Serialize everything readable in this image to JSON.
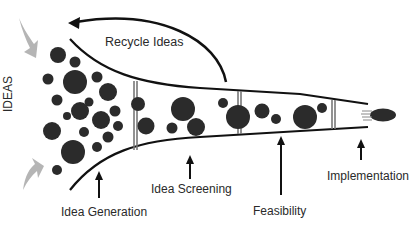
{
  "diagram": {
    "labels": {
      "ideas": "IDEAS",
      "recycle": "Recycle Ideas",
      "idea_generation": "Idea Generation",
      "idea_screening": "Idea Screening",
      "feasibility": "Feasibility",
      "implementation": "Implementation"
    },
    "stages": [
      "Idea Generation",
      "Idea Screening",
      "Feasibility",
      "Implementation"
    ],
    "colors": {
      "circle": "#2b2b2b",
      "line": "#111111",
      "divider": "#777777",
      "input_arrow": "#b5b5b5",
      "text": "#2a2a2a"
    },
    "icons": {
      "input_arrow_top": "curved-arrow-down",
      "input_arrow_bottom": "curved-arrow-up",
      "recycle_arrow": "curved-arrow-left",
      "final_product": "speeding-ellipse"
    }
  }
}
